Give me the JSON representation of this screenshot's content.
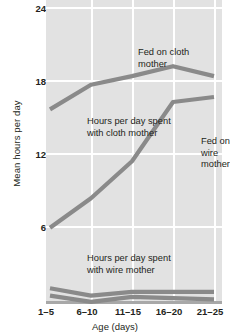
{
  "chart_data": {
    "type": "line",
    "title": "",
    "xlabel": "Age (days)",
    "ylabel": "Mean hours per day",
    "categories": [
      "1–5",
      "6–10",
      "11–15",
      "16–20",
      "21–25"
    ],
    "ylim": [
      0,
      24
    ],
    "yticks": [
      6,
      12,
      18,
      24
    ],
    "ytick_labels": [
      "6",
      "12",
      "18",
      "24"
    ],
    "grid": true,
    "legend": "in-plot annotations",
    "series": [
      {
        "name": "Hours per day spent with cloth mother",
        "values": [
          15.7,
          17.7,
          18.4,
          19.2,
          18.4
        ]
      },
      {
        "name": "Hours per day spent with wire mother",
        "values": [
          6.1,
          8.5,
          11.5,
          16.3,
          16.7
        ]
      },
      {
        "name": "Fed on cloth mother",
        "values": [
          1.2,
          0.6,
          0.9,
          0.9,
          0.9
        ]
      },
      {
        "name": "Fed on wire mother",
        "values": [
          0.6,
          0.1,
          0.5,
          0.4,
          0.3
        ]
      }
    ],
    "annotations": [
      {
        "id": "fed-on-cloth-mother",
        "text": "Fed on cloth\nmother"
      },
      {
        "id": "hours-with-cloth-mother",
        "text": "Hours per day spent\nwith cloth mother"
      },
      {
        "id": "fed-on-wire-mother",
        "text": "Fed on wire\nmother"
      },
      {
        "id": "hours-with-wire-mother",
        "text": "Hours per day spent\nwith wire mother"
      }
    ],
    "colors": {
      "plot_background": "#e2e2e2",
      "gridline": "#ffffff",
      "line": "#8a8a8a",
      "axis": "#a8a8a8",
      "text": "#231f20"
    }
  },
  "axes": {
    "y_title": "Mean hours per day",
    "x_title": "Age (days)",
    "y_ticks": [
      "24",
      "18",
      "12",
      "6"
    ],
    "x_ticks": [
      "1–5",
      "6–10",
      "11–15",
      "16–20",
      "21–25"
    ]
  },
  "labels": {
    "fed_cloth": "Fed on cloth\nmother",
    "hours_cloth": "Hours per day spent\nwith cloth mother",
    "fed_wire": "Fed on wire\nmother",
    "hours_wire": "Hours per day spent\nwith wire mother"
  }
}
